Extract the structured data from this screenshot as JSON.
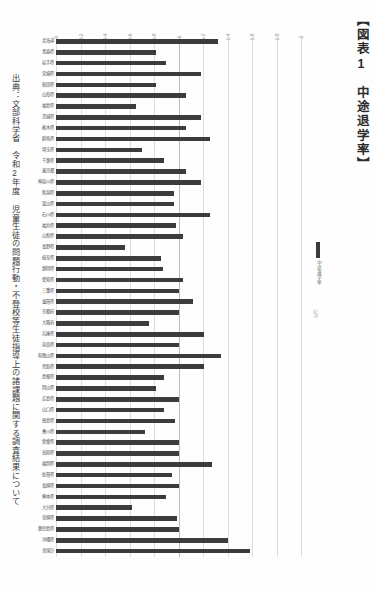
{
  "document": {
    "title": "【図表1　中途退学率】",
    "source": "出典：文部科学省　令和2年度 児童生徒の問題行動・不登校等生徒指導上の諸課題に関する調査結果について"
  },
  "legend": {
    "swatch_label": "中途退学率",
    "axis_title": "（％）",
    "swatch_color": "#3c3c3c"
  },
  "chart_data": {
    "type": "bar",
    "orientation": "horizontal",
    "title": "中途退学率",
    "xlabel": "（％）",
    "ylabel": "",
    "xlim": [
      0,
      2.0
    ],
    "grid": true,
    "legend_position": "right",
    "tick_labels": [
      "0",
      "0.2",
      "0.4",
      "0.6",
      "0.8",
      "1",
      "1.2",
      "1.4",
      "1.6",
      "1.8",
      "2"
    ],
    "tick_values": [
      0,
      0.2,
      0.4,
      0.6,
      0.8,
      1,
      1.2,
      1.4,
      1.6,
      1.8,
      2
    ],
    "bar_color": "#3c3c3c",
    "categories": [
      "北海道",
      "青森県",
      "岩手県",
      "宮城県",
      "秋田県",
      "山形県",
      "福島県",
      "茨城県",
      "栃木県",
      "群馬県",
      "埼玉県",
      "千葉県",
      "東京都",
      "神奈川県",
      "新潟県",
      "富山県",
      "石川県",
      "福井県",
      "山梨県",
      "長野県",
      "岐阜県",
      "静岡県",
      "愛知県",
      "三重県",
      "滋賀県",
      "京都府",
      "大阪府",
      "兵庫県",
      "奈良県",
      "和歌山県",
      "鳥取県",
      "島根県",
      "岡山県",
      "広島県",
      "山口県",
      "徳島県",
      "香川県",
      "愛媛県",
      "高知県",
      "福岡県",
      "佐賀県",
      "長崎県",
      "熊本県",
      "大分県",
      "宮崎県",
      "鹿児島県",
      "沖縄県",
      "全国計"
    ],
    "values": [
      1.32,
      0.82,
      0.9,
      1.18,
      0.82,
      1.06,
      0.65,
      1.18,
      1.06,
      1.26,
      0.7,
      0.88,
      1.06,
      1.18,
      0.96,
      0.96,
      1.26,
      0.98,
      1.04,
      0.56,
      0.86,
      0.87,
      1.04,
      1.0,
      1.12,
      1.0,
      0.76,
      1.21,
      1.0,
      1.35,
      1.21,
      0.88,
      0.82,
      1.0,
      0.88,
      0.97,
      0.73,
      1.0,
      1.0,
      1.27,
      0.95,
      1.0,
      0.9,
      0.62,
      0.99,
      1.0,
      1.4,
      1.58
    ]
  }
}
